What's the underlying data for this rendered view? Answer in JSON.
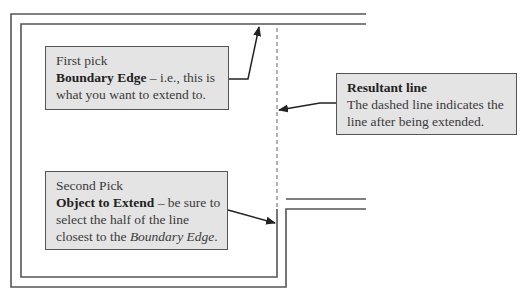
{
  "callouts": {
    "first": {
      "title": "First pick",
      "bold": "Boundary Edge",
      "rest1": " – i.e., this is",
      "line3": "what you want to extend to."
    },
    "second": {
      "title": "Second Pick",
      "bold": "Object to Extend",
      "rest1": " – be sure to",
      "line3": "select the half of the line",
      "line4_prefix": "closest to the ",
      "line4_italic": "Boundary Edge",
      "line4_suffix": "."
    },
    "resultant": {
      "title": "Resultant line",
      "line2": "The dashed line indicates the",
      "line3": "line after being extended."
    }
  },
  "colors": {
    "line": "#555555",
    "callout_fill": "#e4e4e4",
    "arrow": "#222222"
  }
}
